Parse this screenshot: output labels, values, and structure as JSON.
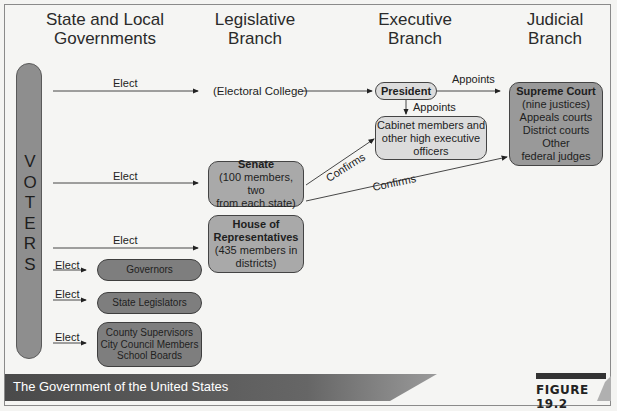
{
  "headers": {
    "state_local": [
      "State and Local",
      "Governments"
    ],
    "legislative": [
      "Legislative",
      "Branch"
    ],
    "executive": [
      "Executive",
      "Branch"
    ],
    "judicial": [
      "Judicial",
      "Branch"
    ]
  },
  "voters": {
    "letters": [
      "V",
      "O",
      "T",
      "E",
      "R",
      "S"
    ]
  },
  "arrows": {
    "elect_electoral": "Elect",
    "elect_senate": "Elect",
    "elect_house": "Elect",
    "elect_governors": "Elect",
    "elect_state_leg": "Elect",
    "elect_local": "Elect",
    "appoints_court": "Appoints",
    "appoints_cabinet": "Appoints",
    "confirms_cabinet": "Confirms",
    "confirms_court": "Confirms"
  },
  "nodes": {
    "electoral_college": "(Electoral College)",
    "president": "President",
    "cabinet": [
      "Cabinet members and",
      "other high executive",
      "officers"
    ],
    "supreme_court": {
      "title": "Supreme Court",
      "lines": [
        "(nine justices)",
        "Appeals courts",
        "District courts",
        "Other",
        "federal judges"
      ]
    },
    "senate": {
      "title": "Senate",
      "lines": [
        "(100 members, two",
        "from each state)"
      ]
    },
    "house": {
      "title_lines": [
        "House of",
        "Representatives"
      ],
      "lines": [
        "(435 members in",
        "districts)"
      ]
    },
    "governors": "Governors",
    "state_legislators": "State Legislators",
    "local": [
      "County Supervisors",
      "City Council Members",
      "School Boards"
    ]
  },
  "footer": {
    "caption": "The Government of the United States",
    "figure": "FIGURE 19.2"
  },
  "colors": {
    "voters_bar": "#8e8e8e",
    "legislative_box": "#a9a9a9",
    "executive_box": "#dcdcdc",
    "judicial_box": "#999999",
    "local_box": "#7e7e7e",
    "footer_band": "#4e4e4e"
  }
}
